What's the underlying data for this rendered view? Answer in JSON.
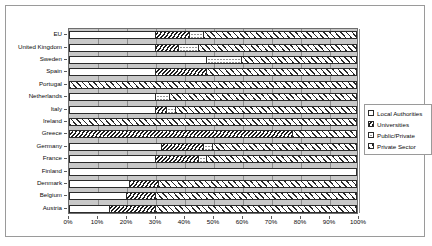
{
  "chart_data": {
    "type": "bar",
    "orientation": "horizontal",
    "stacked": true,
    "normalized_percent": true,
    "title": "",
    "xlabel": "",
    "ylabel": "",
    "xlim": [
      0,
      100
    ],
    "grid": true,
    "legend_position": "right",
    "x_tick_labels": [
      "0%",
      "10%",
      "20%",
      "30%",
      "40%",
      "50%",
      "60%",
      "70%",
      "80%",
      "90%",
      "100%"
    ],
    "x_tick_values": [
      0,
      10,
      20,
      30,
      40,
      50,
      60,
      70,
      80,
      90,
      100
    ],
    "categories": [
      "EU",
      "United Kingdom",
      "Sweden",
      "Spain",
      "Portugal",
      "Netherlands",
      "Italy",
      "Ireland",
      "Greece",
      "Germany",
      "France",
      "Finland",
      "Denmark",
      "Belgium",
      "Austria"
    ],
    "series": [
      {
        "name": "Local Authorities",
        "pattern": "dotted-sparse",
        "values": [
          30,
          30,
          48,
          30,
          0,
          30,
          30,
          0,
          0,
          32,
          30,
          100,
          21,
          20,
          14
        ]
      },
      {
        "name": "Universities",
        "pattern": "dense-diagonal-hatch",
        "values": [
          12,
          8,
          0,
          18,
          0,
          0,
          4,
          0,
          78,
          15,
          15,
          0,
          10,
          10,
          16
        ]
      },
      {
        "name": "Public/Private",
        "pattern": "dotted-dense",
        "values": [
          5,
          7,
          12,
          0,
          0,
          5,
          3,
          0,
          0,
          3,
          3,
          0,
          0,
          0,
          0
        ]
      },
      {
        "name": "Private Sector",
        "pattern": "light-diagonal-hatch",
        "values": [
          53,
          55,
          40,
          52,
          100,
          65,
          63,
          100,
          22,
          50,
          52,
          0,
          69,
          70,
          70
        ]
      }
    ]
  },
  "legend": {
    "items": [
      {
        "label": "Local Authorities",
        "pattern": "dotted-sparse"
      },
      {
        "label": "Universities",
        "pattern": "dense-diagonal-hatch"
      },
      {
        "label": "Public/Private",
        "pattern": "dotted-dense"
      },
      {
        "label": "Private Sector",
        "pattern": "light-diagonal-hatch"
      }
    ]
  },
  "colors": {
    "plot_background": "#c8c8c8",
    "frame_border": "#9a9a9a",
    "gridline": "#8c8c8c",
    "bar_outline": "#2b2b2b",
    "text": "#0b0b0b",
    "page_background": "#ffffff"
  }
}
